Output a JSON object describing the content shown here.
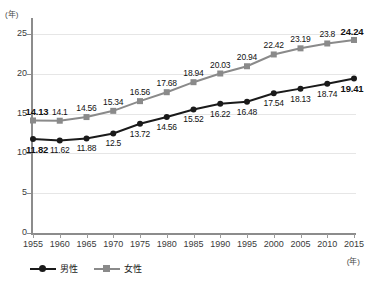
{
  "chart_data": {
    "type": "line",
    "title": "",
    "xlabel": "(年)",
    "ylabel": "(年)",
    "x": [
      1955,
      1960,
      1965,
      1970,
      1975,
      1980,
      1985,
      1990,
      1995,
      2000,
      2005,
      2010,
      2015
    ],
    "categories": [
      "1955",
      "1960",
      "1965",
      "1970",
      "1975",
      "1980",
      "1985",
      "1990",
      "1995",
      "2000",
      "2005",
      "2010",
      "2015"
    ],
    "xlim": [
      1955,
      2015
    ],
    "ylim": [
      0,
      27
    ],
    "yticks": [
      "0",
      "5",
      "10",
      "15",
      "20",
      "25"
    ],
    "ytick_values": [
      0,
      5,
      10,
      15,
      20,
      25
    ],
    "grid": true,
    "legend_position": "bottom-left",
    "series": [
      {
        "name": "男性",
        "color": "#1a1a1a",
        "marker": "circle",
        "label_position": "below",
        "values": [
          11.82,
          11.62,
          11.88,
          12.5,
          13.72,
          14.56,
          15.52,
          16.22,
          16.48,
          17.54,
          18.13,
          18.74,
          19.41
        ],
        "value_labels": [
          "11.82",
          "11.62",
          "11.88",
          "12.5",
          "13.72",
          "14.56",
          "15.52",
          "16.22",
          "16.48",
          "17.54",
          "18.13",
          "18.74",
          "19.41"
        ],
        "bold_labels": [
          0,
          12
        ]
      },
      {
        "name": "女性",
        "color": "#8a8a8a",
        "marker": "square",
        "label_position": "above",
        "values": [
          14.13,
          14.1,
          14.56,
          15.34,
          16.56,
          17.68,
          18.94,
          20.03,
          20.94,
          22.42,
          23.19,
          23.8,
          24.24
        ],
        "value_labels": [
          "14.13",
          "14.1",
          "14.56",
          "15.34",
          "16.56",
          "17.68",
          "18.94",
          "20.03",
          "20.94",
          "22.42",
          "23.19",
          "23.8",
          "24.24"
        ],
        "bold_labels": [
          0,
          12
        ]
      }
    ]
  },
  "legend": {
    "items": [
      {
        "label": "男性",
        "color": "#1a1a1a",
        "marker": "circle"
      },
      {
        "label": "女性",
        "color": "#8a8a8a",
        "marker": "square"
      }
    ]
  },
  "axis": {
    "y_unit": "(年)",
    "x_unit": "(年)"
  }
}
